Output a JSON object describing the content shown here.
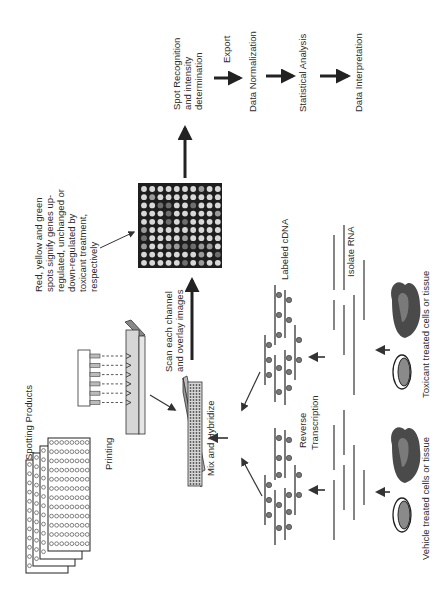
{
  "figure": {
    "orientation": "rotated-90-ccw",
    "pipeline": {
      "spot_recognition": [
        "Spot Recognition",
        "and intensity",
        "determination"
      ],
      "export": "Export",
      "data_normalization": "Data Normalization",
      "statistical_analysis": "Statistical Analysis",
      "data_interpretation": "Data Interpretation"
    },
    "annotation": [
      "Red, yellow and green",
      "spots signify genes up-",
      "regulated, unchanged or",
      "down-regulated by",
      "toxicant treatment,",
      "respectively"
    ],
    "scan": [
      "Scan each channel",
      "and overlay images"
    ],
    "spotting_products": "Spotting Products",
    "printing": "Printing",
    "mix_and_hybridize": "Mix and Hybridize",
    "reverse_transcription": [
      "Reverse",
      "Transcription"
    ],
    "labeled_cdna": "Labeled cDNA",
    "isolate_rna": "Isolate RNA",
    "vehicle_label": "Vehicle treated cells or tissue",
    "toxicant_label": "Toxicant treated cells or tissue",
    "microarray": {
      "rows": 10,
      "cols": 10,
      "spot_colors": [
        "#d8d8d8",
        "#9a9a9a",
        "#6e6e6e"
      ]
    },
    "colors": {
      "ink": "#2a2a2a",
      "array_bg": "#1e1e1e",
      "slide_fill": "#d6d6d6",
      "spot": "#7a7a7a"
    }
  }
}
